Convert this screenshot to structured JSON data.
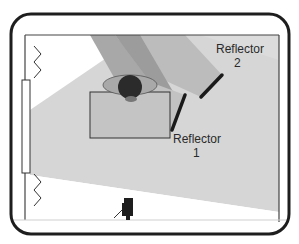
{
  "diagram": {
    "type": "lighting-setup-floor-plan",
    "labels": {
      "reflector_2": {
        "line1": "Reflector",
        "line2": "2"
      },
      "reflector_1": {
        "line1": "Reflector",
        "line2": "1"
      }
    },
    "elements": [
      "room-frame",
      "window",
      "window-light-beam",
      "subject-head",
      "subject-shoulders",
      "desk",
      "reflector-1",
      "reflector-2",
      "camera"
    ],
    "colors": {
      "frame": "#1e1e1e",
      "room_fill": "#d4d4d4",
      "light_beam": "#c8c8c8",
      "bounce_beam": "#b2b2b2",
      "dark_wedge": "#9a9a9a",
      "desk_fill": "#bdbdbd",
      "reflector": "#1a1a1a",
      "head": "#2a2a2a",
      "shoulders": "#a9a9a9",
      "window": "#ffffff"
    }
  }
}
